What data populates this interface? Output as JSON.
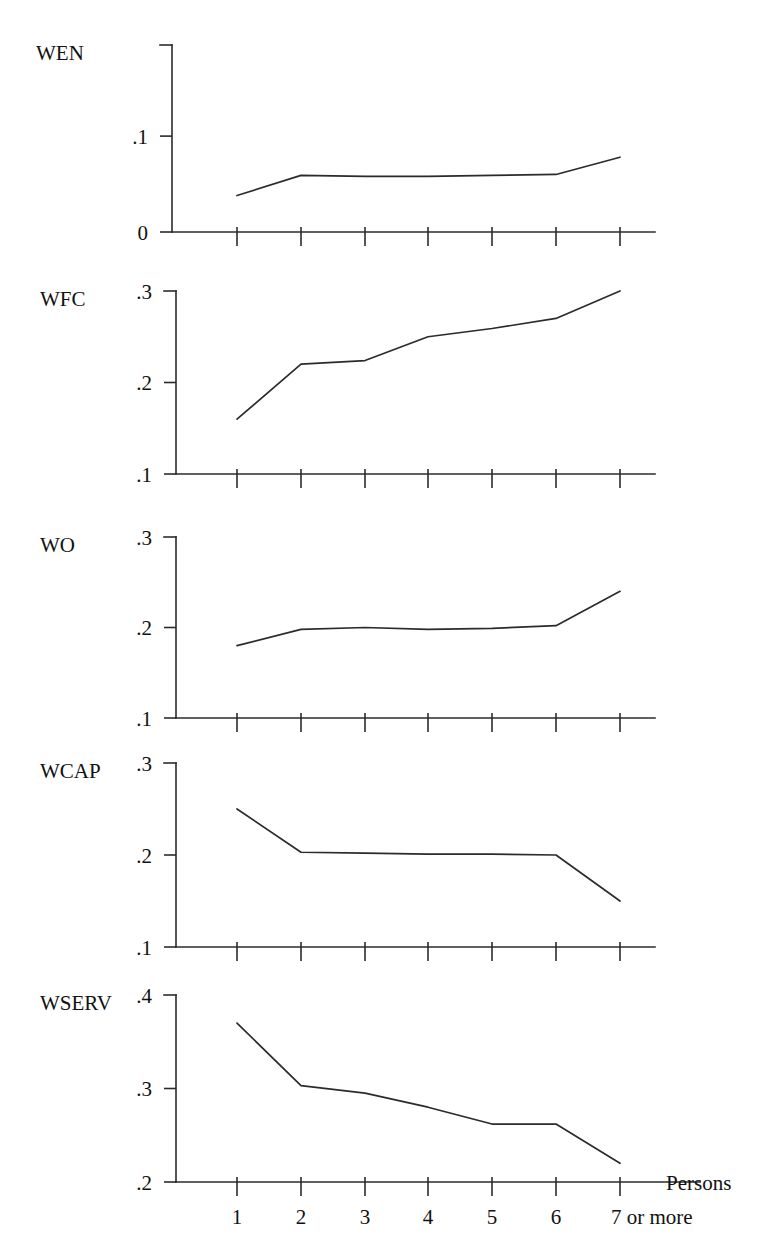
{
  "chart_data": [
    {
      "type": "line",
      "title": "WEN",
      "xlabel": "Persons",
      "ylabel": "",
      "x": [
        1,
        2,
        3,
        4,
        5,
        6,
        7
      ],
      "categories": [
        "1",
        "2",
        "3",
        "4",
        "5",
        "6",
        "7 or more"
      ],
      "values": [
        0.038,
        0.059,
        0.058,
        0.058,
        0.059,
        0.06,
        0.078
      ],
      "ylim": [
        0,
        0.195
      ],
      "yticks": [
        0,
        0.1
      ],
      "ytick_labels": [
        "0",
        ".1"
      ],
      "grid": false,
      "legend": "none"
    },
    {
      "type": "line",
      "title": "WFC",
      "xlabel": "Persons",
      "ylabel": "",
      "x": [
        1,
        2,
        3,
        4,
        5,
        6,
        7
      ],
      "categories": [
        "1",
        "2",
        "3",
        "4",
        "5",
        "6",
        "7 or more"
      ],
      "values": [
        0.16,
        0.22,
        0.224,
        0.25,
        0.259,
        0.27,
        0.3
      ],
      "ylim": [
        0.1,
        0.3
      ],
      "yticks": [
        0.1,
        0.2,
        0.3
      ],
      "ytick_labels": [
        ".1",
        ".2",
        ".3"
      ],
      "grid": false,
      "legend": "none"
    },
    {
      "type": "line",
      "title": "WO",
      "xlabel": "Persons",
      "ylabel": "",
      "x": [
        1,
        2,
        3,
        4,
        5,
        6,
        7
      ],
      "categories": [
        "1",
        "2",
        "3",
        "4",
        "5",
        "6",
        "7 or more"
      ],
      "values": [
        0.18,
        0.198,
        0.2,
        0.198,
        0.199,
        0.202,
        0.24
      ],
      "ylim": [
        0.1,
        0.3
      ],
      "yticks": [
        0.1,
        0.2,
        0.3
      ],
      "ytick_labels": [
        ".1",
        ".2",
        ".3"
      ],
      "grid": false,
      "legend": "none"
    },
    {
      "type": "line",
      "title": "WCAP",
      "xlabel": "Persons",
      "ylabel": "",
      "x": [
        1,
        2,
        3,
        4,
        5,
        6,
        7
      ],
      "categories": [
        "1",
        "2",
        "3",
        "4",
        "5",
        "6",
        "7 or more"
      ],
      "values": [
        0.25,
        0.203,
        0.202,
        0.201,
        0.201,
        0.2,
        0.15
      ],
      "ylim": [
        0.1,
        0.3
      ],
      "yticks": [
        0.1,
        0.2,
        0.3
      ],
      "ytick_labels": [
        ".1",
        ".2",
        ".3"
      ],
      "grid": false,
      "legend": "none"
    },
    {
      "type": "line",
      "title": "WSERV",
      "xlabel": "Persons",
      "ylabel": "",
      "x": [
        1,
        2,
        3,
        4,
        5,
        6,
        7
      ],
      "categories": [
        "1",
        "2",
        "3",
        "4",
        "5",
        "6",
        "7 or more"
      ],
      "values": [
        0.37,
        0.303,
        0.295,
        0.28,
        0.262,
        0.262,
        0.22
      ],
      "ylim": [
        0.2,
        0.4
      ],
      "yticks": [
        0.2,
        0.3,
        0.4
      ],
      "ytick_labels": [
        ".2",
        ".3",
        ".4"
      ],
      "grid": false,
      "legend": "none"
    }
  ],
  "figure": {
    "x_axis_label": "Persons",
    "x_tick_labels": [
      "1",
      "2",
      "3",
      "4",
      "5",
      "6",
      "7 or more"
    ],
    "panel_labels": [
      "WEN",
      "WFC",
      "WO",
      "WCAP",
      "WSERV"
    ],
    "line_color": "#2b2b2b",
    "background_color": "#ffffff"
  },
  "layout": {
    "panels": [
      {
        "axis_x": 172,
        "axis_top": 45,
        "axis_bottom": 232,
        "axis_right": 655,
        "label_x": 36,
        "label_y": 52,
        "ytick_label_x": 160
      },
      {
        "axis_x": 176,
        "axis_top": 291,
        "axis_bottom": 474,
        "axis_right": 655,
        "label_x": 40,
        "label_y": 298,
        "ytick_label_x": 164
      },
      {
        "axis_x": 176,
        "axis_top": 537,
        "axis_bottom": 718,
        "axis_right": 655,
        "label_x": 40,
        "label_y": 544,
        "ytick_label_x": 164
      },
      {
        "axis_x": 176,
        "axis_top": 763,
        "axis_bottom": 947,
        "axis_right": 655,
        "label_x": 40,
        "label_y": 770,
        "ytick_label_x": 164
      },
      {
        "axis_x": 176,
        "axis_top": 995,
        "axis_bottom": 1182,
        "axis_right": 700,
        "label_x": 40,
        "label_y": 1002,
        "ytick_label_x": 164
      }
    ],
    "x_positions": [
      237,
      301,
      365,
      428,
      492,
      556,
      620
    ],
    "tick_len_up": 5,
    "tick_len_down": 14,
    "cap_len": 12,
    "xlabel_y": 1224,
    "axis_name_x": 666,
    "axis_name_y": 1190
  }
}
